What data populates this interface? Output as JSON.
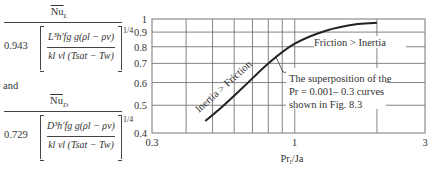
{
  "formulas": {
    "top": {
      "numerator": "Nu",
      "numerator_sub": "L",
      "coefficient": "0.943",
      "bracket_top": "L³h′fg g(ρl − ρv)",
      "bracket_bottom": "kl νl (Tsat − Tw)",
      "exponent": "1/4"
    },
    "connector": "and",
    "bottom": {
      "numerator": "Nu",
      "numerator_sub": "D",
      "coefficient": "0.729",
      "bracket_top": "D³h′fg g(ρl − ρv)",
      "bracket_bottom": "kl νl (Tsat − Tw)",
      "exponent": "1/4"
    }
  },
  "chart_data": {
    "type": "line",
    "title": "",
    "xlabel": "Prl/Ja",
    "ylabel": "NuL / [0.943 (...)^1/4] and NuD / [0.729 (...)^1/4]",
    "xscale": "log",
    "yscale": "log",
    "xlim": [
      0.3,
      3
    ],
    "ylim": [
      0.4,
      1
    ],
    "x_tick_labels": [
      "0.3",
      "1",
      "3"
    ],
    "y_tick_labels": [
      "0.4",
      "0.5",
      "0.6",
      "0.7",
      "0.8",
      "0.9",
      "1"
    ],
    "x_gridlines": [
      0.4,
      0.5,
      0.6,
      0.7,
      0.8,
      0.9,
      1,
      2
    ],
    "y_gridlines": [
      0.5,
      0.6,
      0.7,
      0.8,
      0.9
    ],
    "grid": true,
    "series": [
      {
        "name": "superposition curve",
        "x": [
          0.47,
          0.55,
          0.65,
          0.8,
          1.0,
          1.3,
          1.7,
          2.0
        ],
        "y": [
          0.44,
          0.5,
          0.58,
          0.7,
          0.82,
          0.91,
          0.96,
          0.97
        ]
      }
    ],
    "annotations": [
      {
        "text": "Inertia > Friction",
        "position": "along curve, lower-left",
        "rotation": -40
      },
      {
        "text": "Friction > Inertia",
        "position": "upper right, below curve end"
      },
      {
        "text": "The superposition of the Pr = 0.001– 0.3 curves shown in Fig. 8.3",
        "position": "right-middle, with leader line to curve"
      }
    ]
  }
}
